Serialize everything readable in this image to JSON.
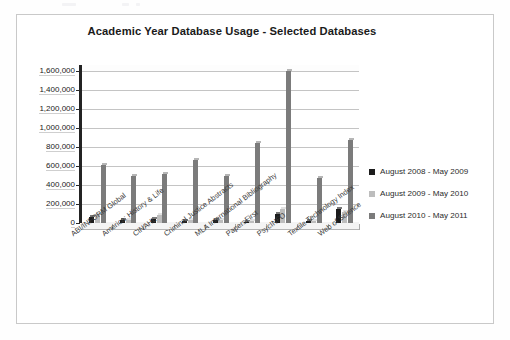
{
  "chart_data": {
    "type": "bar",
    "title": "Academic Year Database Usage - Selected Databases",
    "xlabel": "",
    "ylabel": "",
    "ylim": [
      0,
      1600000
    ],
    "ytick_labels": [
      "1,600,000",
      "1,400,000",
      "1,200,000",
      "1,000,000",
      "800,000",
      "600,000",
      "400,000",
      "200,000",
      "0"
    ],
    "ytick_values": [
      1600000,
      1400000,
      1200000,
      1000000,
      800000,
      600000,
      400000,
      200000,
      0
    ],
    "grid": true,
    "legend_position": "right",
    "categories": [
      "ABI/INFORM Global",
      "America: History & Life",
      "CINAHL",
      "Criminal Justice Abstracts",
      "MLA International Bibliography",
      "PapersFirst",
      "PsycINFO",
      "Textile Technology Index",
      "Web of Science"
    ],
    "series": [
      {
        "name": "August 2008 - May 2009",
        "color": "#1c1c1c",
        "values": [
          60000,
          30000,
          45000,
          25000,
          28000,
          14000,
          100000,
          20000,
          150000
        ]
      },
      {
        "name": "August 2009 - May 2010",
        "color": "#bdbdbd",
        "values": [
          95000,
          35000,
          80000,
          32000,
          30000,
          18000,
          150000,
          25000,
          115000
        ]
      },
      {
        "name": "August 2010 - May 2011",
        "color": "#7b7b7b",
        "values": [
          610000,
          490000,
          520000,
          665000,
          490000,
          840000,
          1595000,
          470000,
          870000
        ]
      }
    ]
  },
  "legend": {
    "items": [
      {
        "label": "August 2008 - May 2009",
        "color": "#1c1c1c"
      },
      {
        "label": "August 2009 - May 2010",
        "color": "#bdbdbd"
      },
      {
        "label": "August 2010 - May 2011",
        "color": "#7b7b7b"
      }
    ]
  }
}
